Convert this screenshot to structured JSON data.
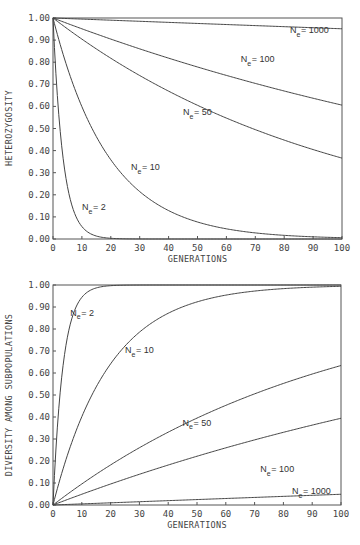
{
  "chart_data": [
    {
      "type": "line",
      "title": "",
      "xlabel": "GENERATIONS",
      "ylabel": "HETEROZYGOSITY",
      "xlim": [
        0,
        100
      ],
      "ylim": [
        0,
        1
      ],
      "grid": false,
      "legend": "inline curve labels",
      "x_ticks": [
        "0",
        "10",
        "20",
        "30",
        "40",
        "50",
        "60",
        "70",
        "80",
        "90",
        "100"
      ],
      "y_ticks": [
        "0.00",
        "0.10",
        "0.20",
        "0.30",
        "0.40",
        "0.50",
        "0.60",
        "0.70",
        "0.80",
        "0.90",
        "1.00"
      ],
      "x": [
        0,
        10,
        20,
        30,
        40,
        50,
        60,
        70,
        80,
        90,
        100
      ],
      "series": [
        {
          "name": "Ne = 2",
          "Ne": 2,
          "values": [
            1.0,
            0.06,
            0.0,
            0.0,
            0.0,
            0.0,
            0.0,
            0.0,
            0.0,
            0.0,
            0.0
          ]
        },
        {
          "name": "Ne = 10",
          "Ne": 10,
          "values": [
            1.0,
            0.6,
            0.36,
            0.21,
            0.13,
            0.08,
            0.05,
            0.03,
            0.02,
            0.01,
            0.01
          ]
        },
        {
          "name": "Ne = 50",
          "Ne": 50,
          "values": [
            1.0,
            0.9,
            0.82,
            0.74,
            0.67,
            0.61,
            0.55,
            0.49,
            0.45,
            0.4,
            0.37
          ]
        },
        {
          "name": "Ne = 100",
          "Ne": 100,
          "values": [
            1.0,
            0.95,
            0.9,
            0.86,
            0.82,
            0.78,
            0.74,
            0.7,
            0.67,
            0.64,
            0.61
          ]
        },
        {
          "name": "Ne = 1000",
          "Ne": 1000,
          "values": [
            1.0,
            0.995,
            0.99,
            0.985,
            0.98,
            0.975,
            0.97,
            0.966,
            0.961,
            0.956,
            0.951
          ]
        }
      ],
      "labels": [
        {
          "text": "N",
          "sub": "e",
          "rest": " = 1000",
          "x": 82,
          "y": 0.93
        },
        {
          "text": "N",
          "sub": "e",
          "rest": " = 100",
          "x": 65,
          "y": 0.8
        },
        {
          "text": "N",
          "sub": "e",
          "rest": " = 50",
          "x": 45,
          "y": 0.56
        },
        {
          "text": "N",
          "sub": "e",
          "rest": " = 10",
          "x": 27,
          "y": 0.31
        },
        {
          "text": "N",
          "sub": "e",
          "rest": " = 2",
          "x": 10,
          "y": 0.13
        }
      ]
    },
    {
      "type": "line",
      "title": "",
      "xlabel": "GENERATIONS",
      "ylabel": "DIVERSITY AMONG SUBPOPULATIONS",
      "xlim": [
        0,
        100
      ],
      "ylim": [
        0,
        1
      ],
      "grid": false,
      "legend": "inline curve labels",
      "x_ticks": [
        "0",
        "10",
        "20",
        "30",
        "40",
        "50",
        "60",
        "70",
        "80",
        "90",
        "100"
      ],
      "y_ticks": [
        "0.00",
        "0.10",
        "0.20",
        "0.30",
        "0.40",
        "0.50",
        "0.60",
        "0.70",
        "0.80",
        "0.90",
        "1.00"
      ],
      "x": [
        0,
        10,
        20,
        30,
        40,
        50,
        60,
        70,
        80,
        90,
        100
      ],
      "series": [
        {
          "name": "Ne = 2",
          "Ne": 2,
          "values": [
            0.0,
            0.94,
            1.0,
            1.0,
            1.0,
            1.0,
            1.0,
            1.0,
            1.0,
            1.0,
            1.0
          ]
        },
        {
          "name": "Ne = 10",
          "Ne": 10,
          "values": [
            0.0,
            0.4,
            0.64,
            0.79,
            0.87,
            0.92,
            0.95,
            0.97,
            0.98,
            0.99,
            0.99
          ]
        },
        {
          "name": "Ne = 50",
          "Ne": 50,
          "values": [
            0.0,
            0.1,
            0.18,
            0.26,
            0.33,
            0.39,
            0.45,
            0.51,
            0.55,
            0.6,
            0.63
          ]
        },
        {
          "name": "Ne = 100",
          "Ne": 100,
          "values": [
            0.0,
            0.05,
            0.1,
            0.14,
            0.18,
            0.22,
            0.26,
            0.3,
            0.33,
            0.36,
            0.39
          ]
        },
        {
          "name": "Ne = 1000",
          "Ne": 1000,
          "values": [
            0.0,
            0.005,
            0.01,
            0.015,
            0.02,
            0.025,
            0.03,
            0.034,
            0.039,
            0.044,
            0.049
          ]
        }
      ],
      "labels": [
        {
          "text": "N",
          "sub": "e",
          "rest": " = 2",
          "x": 6,
          "y": 0.86
        },
        {
          "text": "N",
          "sub": "e",
          "rest": " = 10",
          "x": 25,
          "y": 0.69
        },
        {
          "text": "N",
          "sub": "e",
          "rest": " = 50",
          "x": 45,
          "y": 0.36
        },
        {
          "text": "N",
          "sub": "e",
          "rest": " = 100",
          "x": 72,
          "y": 0.15
        },
        {
          "text": "N",
          "sub": "e",
          "rest": " = 1000",
          "x": 83,
          "y": 0.05
        }
      ]
    }
  ],
  "charts": [
    {
      "ylabel": "HETEROZYGOSITY",
      "xlabel": "GENERATIONS"
    },
    {
      "ylabel": "DIVERSITY AMONG SUBPOPULATIONS",
      "xlabel": "GENERATIONS"
    }
  ],
  "style": {
    "line_color": "#444444",
    "frame_color": "#555555",
    "background": "#ffffff"
  }
}
